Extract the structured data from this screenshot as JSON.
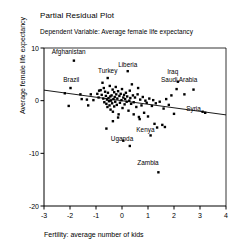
{
  "chart_data": {
    "type": "scatter",
    "title": "Partial Residual Plot",
    "subtitle": "Dependent Variable: Average female life expectancy",
    "xlabel": "Fertility: average number of kids",
    "ylabel": "Average female life expectancy",
    "xlim": [
      -3,
      4
    ],
    "ylim": [
      -20,
      10
    ],
    "xticks": [
      -3,
      -2,
      -1,
      0,
      1,
      2,
      3,
      4
    ],
    "xticklabels": [
      "-3",
      "-2",
      "-1",
      "0",
      "1",
      "2",
      "3",
      "4"
    ],
    "yticks": [
      10,
      0,
      -10,
      -20
    ],
    "yticklabels": [
      "10",
      "0",
      "-10",
      "-20"
    ],
    "grid": false,
    "legend": null,
    "marker": "square",
    "marker_color": "#000000",
    "line_color": "#000000",
    "fit_line": {
      "label": "linear fit",
      "x": [
        -3,
        4
      ],
      "y": [
        2.0,
        -2.7
      ]
    },
    "annotations": [
      {
        "text": "Afghanistan",
        "x": -2.05,
        "y": 8.9
      },
      {
        "text": "Brazil",
        "x": -1.95,
        "y": 3.6
      },
      {
        "text": "Turkey",
        "x": -0.55,
        "y": 5.2
      },
      {
        "text": "Liberia",
        "x": 0.22,
        "y": 6.4
      },
      {
        "text": "Iraq",
        "x": 1.95,
        "y": 5.0
      },
      {
        "text": "Saudi Arabia",
        "x": 2.2,
        "y": 3.6
      },
      {
        "text": "Syria",
        "x": 2.75,
        "y": -1.9
      },
      {
        "text": "Kenya",
        "x": 0.9,
        "y": -6.0
      },
      {
        "text": "Uganda",
        "x": 0.0,
        "y": -7.6
      },
      {
        "text": "Zambia",
        "x": 1.0,
        "y": -12.3
      }
    ],
    "points": [
      {
        "x": -1.85,
        "y": 7.6
      },
      {
        "x": -1.98,
        "y": 2.4
      },
      {
        "x": -2.05,
        "y": -1.0
      },
      {
        "x": -2.2,
        "y": 1.4
      },
      {
        "x": -1.55,
        "y": 0.3
      },
      {
        "x": -1.35,
        "y": 0.2
      },
      {
        "x": -1.2,
        "y": 1.2
      },
      {
        "x": -1.1,
        "y": 0.1
      },
      {
        "x": -0.95,
        "y": 1.3
      },
      {
        "x": -0.9,
        "y": 0.6
      },
      {
        "x": -0.88,
        "y": 1.9
      },
      {
        "x": -0.82,
        "y": 2.0
      },
      {
        "x": -0.78,
        "y": 1.1
      },
      {
        "x": -0.75,
        "y": 3.4
      },
      {
        "x": -0.72,
        "y": 0.4
      },
      {
        "x": -0.7,
        "y": 2.4
      },
      {
        "x": -0.68,
        "y": -0.3
      },
      {
        "x": -0.65,
        "y": 1.7
      },
      {
        "x": -0.62,
        "y": 0.9
      },
      {
        "x": -0.6,
        "y": -0.6
      },
      {
        "x": -0.58,
        "y": 0.2
      },
      {
        "x": -0.56,
        "y": -1.2
      },
      {
        "x": -0.55,
        "y": 4.3
      },
      {
        "x": -0.54,
        "y": 1.5
      },
      {
        "x": -0.52,
        "y": 0.5
      },
      {
        "x": -0.5,
        "y": -0.1
      },
      {
        "x": -0.48,
        "y": -0.9
      },
      {
        "x": -0.47,
        "y": 2.8
      },
      {
        "x": -0.45,
        "y": 0.8
      },
      {
        "x": -0.44,
        "y": -1.7
      },
      {
        "x": -0.42,
        "y": 0.0
      },
      {
        "x": -0.4,
        "y": 1.0
      },
      {
        "x": -0.38,
        "y": -0.5
      },
      {
        "x": -0.36,
        "y": 2.1
      },
      {
        "x": -0.35,
        "y": -2.1
      },
      {
        "x": -0.33,
        "y": 0.3
      },
      {
        "x": -0.3,
        "y": 1.6
      },
      {
        "x": -0.3,
        "y": -1.1
      },
      {
        "x": -0.28,
        "y": 0.7
      },
      {
        "x": -0.26,
        "y": -0.2
      },
      {
        "x": -0.24,
        "y": 2.6
      },
      {
        "x": -0.22,
        "y": 1.2
      },
      {
        "x": -0.2,
        "y": -0.8
      },
      {
        "x": -0.18,
        "y": 0.4
      },
      {
        "x": -0.15,
        "y": 1.8
      },
      {
        "x": -0.13,
        "y": -2.6
      },
      {
        "x": -0.1,
        "y": 0.9
      },
      {
        "x": -0.08,
        "y": -0.4
      },
      {
        "x": -0.05,
        "y": 1.3
      },
      {
        "x": -0.02,
        "y": 0.1
      },
      {
        "x": 0.0,
        "y": 2.2
      },
      {
        "x": 0.02,
        "y": -1.4
      },
      {
        "x": 0.05,
        "y": 0.6
      },
      {
        "x": 0.08,
        "y": 1.1
      },
      {
        "x": 0.1,
        "y": -0.7
      },
      {
        "x": 0.12,
        "y": 0.3
      },
      {
        "x": 0.15,
        "y": 1.5
      },
      {
        "x": 0.18,
        "y": -0.2
      },
      {
        "x": 0.2,
        "y": 0.8
      },
      {
        "x": 0.22,
        "y": 5.6
      },
      {
        "x": 0.25,
        "y": -1.9
      },
      {
        "x": 0.28,
        "y": 0.0
      },
      {
        "x": 0.3,
        "y": 1.9
      },
      {
        "x": 0.32,
        "y": 0.5
      },
      {
        "x": 0.35,
        "y": -0.6
      },
      {
        "x": 0.38,
        "y": 3.1
      },
      {
        "x": 0.42,
        "y": 1.0
      },
      {
        "x": 0.45,
        "y": -0.3
      },
      {
        "x": 0.5,
        "y": 0.6
      },
      {
        "x": 0.55,
        "y": -1.2
      },
      {
        "x": 0.6,
        "y": 1.2
      },
      {
        "x": 0.62,
        "y": 2.4
      },
      {
        "x": 0.65,
        "y": -3.1
      },
      {
        "x": 0.68,
        "y": -3.5
      },
      {
        "x": 0.7,
        "y": 0.2
      },
      {
        "x": 0.75,
        "y": -0.9
      },
      {
        "x": 0.8,
        "y": 0.7
      },
      {
        "x": 0.85,
        "y": -2.3
      },
      {
        "x": 0.9,
        "y": 0.0
      },
      {
        "x": 0.95,
        "y": -0.4
      },
      {
        "x": 1.0,
        "y": -3.0
      },
      {
        "x": 1.05,
        "y": 0.4
      },
      {
        "x": 1.1,
        "y": -6.6
      },
      {
        "x": 1.15,
        "y": -1.0
      },
      {
        "x": 1.2,
        "y": 0.1
      },
      {
        "x": 1.25,
        "y": -4.4
      },
      {
        "x": 1.3,
        "y": -0.5
      },
      {
        "x": 1.35,
        "y": -5.1
      },
      {
        "x": 1.4,
        "y": -13.6
      },
      {
        "x": 1.45,
        "y": -0.2
      },
      {
        "x": 1.55,
        "y": -4.6
      },
      {
        "x": 1.6,
        "y": -1.5
      },
      {
        "x": 1.65,
        "y": -5.0
      },
      {
        "x": 1.7,
        "y": 0.3
      },
      {
        "x": 1.8,
        "y": -0.8
      },
      {
        "x": 1.9,
        "y": 1.0
      },
      {
        "x": 2.0,
        "y": -2.5
      },
      {
        "x": 2.1,
        "y": 2.2
      },
      {
        "x": 2.15,
        "y": 3.6
      },
      {
        "x": 2.4,
        "y": 1.2
      },
      {
        "x": 2.75,
        "y": 2.1
      },
      {
        "x": 3.1,
        "y": -2.1
      },
      {
        "x": 3.2,
        "y": -2.3
      },
      {
        "x": -0.6,
        "y": -5.3
      },
      {
        "x": 0.05,
        "y": -7.6
      },
      {
        "x": 0.3,
        "y": -8.6
      },
      {
        "x": -0.35,
        "y": -3.9
      },
      {
        "x": -0.15,
        "y": -3.2
      },
      {
        "x": 0.45,
        "y": -2.6
      },
      {
        "x": -1.6,
        "y": 1.2
      },
      {
        "x": -1.3,
        "y": -0.9
      }
    ]
  }
}
